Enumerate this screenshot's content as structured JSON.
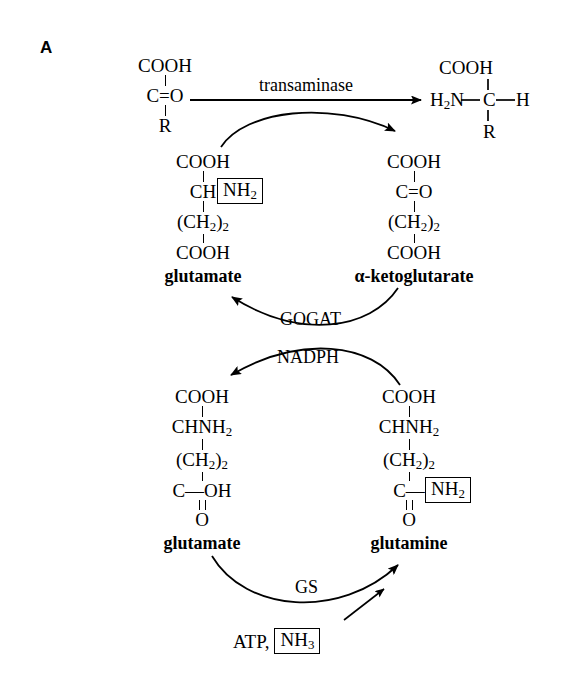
{
  "figure": {
    "panel_label": "A",
    "width": 564,
    "height": 689,
    "background_color": "#ffffff",
    "ink_color": "#000000"
  },
  "reactions": {
    "transaminase": {
      "enzyme_label": "transaminase",
      "arrow_direction": "left-to-right"
    },
    "gogat": {
      "enzyme_label": "GOGAT",
      "cofactor_label": "NADPH",
      "arrow_direction": "right-to-left"
    },
    "gs": {
      "enzyme_label": "GS",
      "substrate_label": "ATP,",
      "boxed_substrate": "NH",
      "boxed_substrate_sub": "3",
      "arrow_direction": "left-to-right"
    }
  },
  "molecules": {
    "keto_acid": {
      "name": "",
      "lines": [
        "COOH",
        "C=O",
        "R"
      ]
    },
    "amino_acid": {
      "name": "",
      "formula_center": "C",
      "left_group": "H",
      "left_group_sub": "2",
      "left_group_tail": "N",
      "top_group": "COOH",
      "right_group": "H",
      "bottom_group": "R"
    },
    "glutamate_top": {
      "name": "glutamate",
      "line1": "COOH",
      "line2": "CH",
      "boxed_group": "NH",
      "boxed_group_sub": "2",
      "line3_open": "(CH",
      "line3_sub": "2",
      "line3_close": ")",
      "line3_count": "2",
      "line4": "COOH"
    },
    "alpha_ketoglutarate": {
      "name": "α-ketoglutarate",
      "line1": "COOH",
      "line2": "C=O",
      "line3_open": "(CH",
      "line3_sub": "2",
      "line3_close": ")",
      "line3_count": "2",
      "line4": "COOH"
    },
    "glutamate_bottom": {
      "name": "glutamate",
      "line1": "COOH",
      "line2": "CHNH",
      "line2_sub": "2",
      "line3_open": "(CH",
      "line3_sub": "2",
      "line3_close": ")",
      "line3_count": "2",
      "line4": "C—OH",
      "line5": "O"
    },
    "glutamine": {
      "name": "glutamine",
      "line1": "COOH",
      "line2": "CHNH",
      "line2_sub": "2",
      "line3_open": "(CH",
      "line3_sub": "2",
      "line3_close": ")",
      "line3_count": "2",
      "line4_carbon": "C—",
      "boxed_group": "NH",
      "boxed_group_sub": "2",
      "line5": "O"
    }
  }
}
